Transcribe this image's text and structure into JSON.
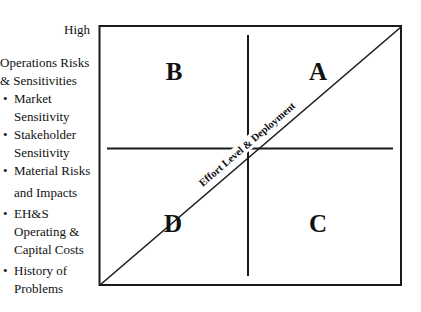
{
  "y_axis": {
    "high_label": "High",
    "title_line1": "Operations Risks",
    "title_line2": "& Sensitivities",
    "factors": [
      {
        "line1": "Market",
        "line2": "Sensitivity"
      },
      {
        "line1": "Stakeholder",
        "line2": "Sensitivity"
      },
      {
        "line1": "Material Risks",
        "line2": "and Impacts"
      },
      {
        "line1": "EH&S",
        "line2": "Operating &",
        "line3": "Capital Costs"
      },
      {
        "line1": "History of",
        "line2": "Problems"
      }
    ]
  },
  "matrix": {
    "quadrants": {
      "top_left": "B",
      "top_right": "A",
      "bottom_left": "D",
      "bottom_right": "C"
    },
    "diagonal_label": "Effort Level & Deployment"
  },
  "colors": {
    "line": "#1a1a1a",
    "background": "#ffffff"
  }
}
